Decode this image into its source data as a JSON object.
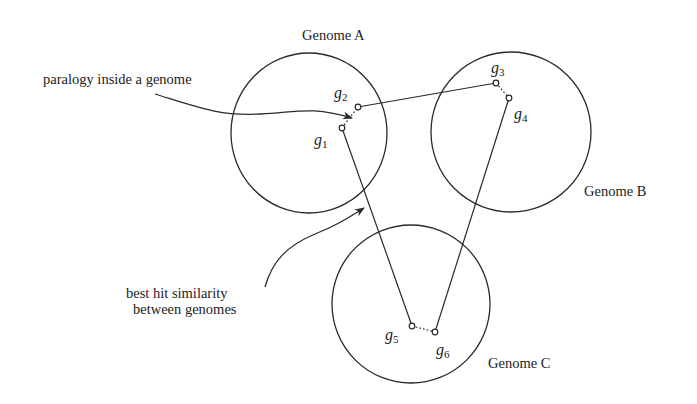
{
  "figure": {
    "genomes": [
      {
        "id": "A",
        "label": "Genome A",
        "cx": 309,
        "cy": 133,
        "rx": 78,
        "ry": 80,
        "label_x": 302,
        "label_y": 40
      },
      {
        "id": "B",
        "label": "Genome B",
        "cx": 511,
        "cy": 132,
        "rx": 80,
        "ry": 80,
        "label_x": 584,
        "label_y": 196
      },
      {
        "id": "C",
        "label": "Genome C",
        "cx": 411,
        "cy": 304,
        "rx": 79,
        "ry": 79,
        "label_x": 488,
        "label_y": 368
      }
    ],
    "genes": [
      {
        "id": "g1",
        "base": "g",
        "sub": "1",
        "genome": "A",
        "x": 342,
        "y": 128,
        "label_x": 314,
        "label_y": 145
      },
      {
        "id": "g2",
        "base": "g",
        "sub": "2",
        "genome": "A",
        "x": 358,
        "y": 107,
        "label_x": 334,
        "label_y": 98
      },
      {
        "id": "g3",
        "base": "g",
        "sub": "3",
        "genome": "B",
        "x": 496,
        "y": 83,
        "label_x": 491,
        "label_y": 73
      },
      {
        "id": "g4",
        "base": "g",
        "sub": "4",
        "genome": "B",
        "x": 509,
        "y": 98,
        "label_x": 514,
        "label_y": 119
      },
      {
        "id": "g5",
        "base": "g",
        "sub": "5",
        "genome": "C",
        "x": 412,
        "y": 326,
        "label_x": 385,
        "label_y": 340
      },
      {
        "id": "g6",
        "base": "g",
        "sub": "6",
        "genome": "C",
        "x": 435,
        "y": 332,
        "label_x": 436,
        "label_y": 355
      }
    ],
    "best_hit_links": [
      {
        "from": "g2",
        "to": "g3"
      },
      {
        "from": "g1",
        "to": "g5"
      },
      {
        "from": "g4",
        "to": "g6"
      }
    ],
    "paralogy_links": [
      {
        "from": "g1",
        "to": "g2"
      },
      {
        "from": "g3",
        "to": "g4"
      },
      {
        "from": "g5",
        "to": "g6"
      }
    ],
    "annotations": {
      "paralogy": {
        "text": "paralogy inside a genome",
        "x": 43,
        "y": 84
      },
      "best_hit": {
        "line1": "best hit similarity",
        "line2": "between genomes",
        "x1": 126,
        "y1": 298,
        "x2": 133,
        "y2": 314
      }
    },
    "colors": {
      "stroke": "#2a2a2a",
      "text": "#222222",
      "background": "#ffffff"
    }
  }
}
